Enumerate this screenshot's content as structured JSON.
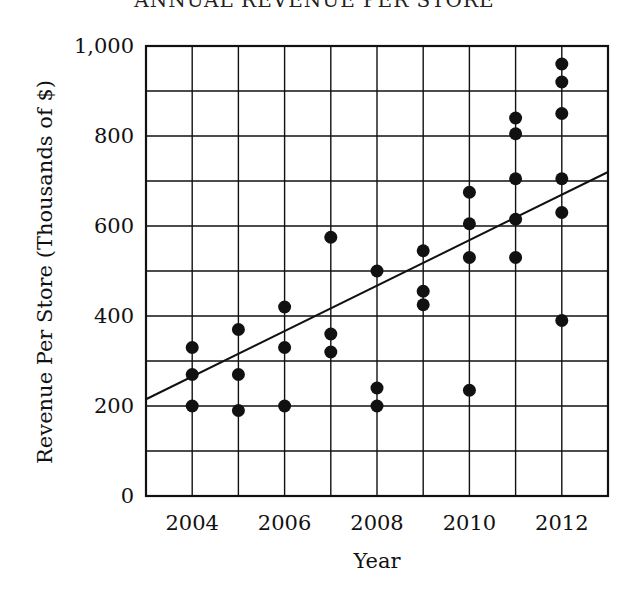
{
  "chart_data": {
    "type": "scatter",
    "title": "ANNUAL REVENUE PER STORE",
    "xlabel": "Year",
    "ylabel": "Revenue Per Store (Thousands of $)",
    "xlim": [
      2003,
      2013
    ],
    "ylim": [
      0,
      1000
    ],
    "x_tick_labels": [
      "2004",
      "2006",
      "2008",
      "2010",
      "2012"
    ],
    "x_ticks": [
      2004,
      2006,
      2008,
      2010,
      2012
    ],
    "y_tick_labels": [
      "0",
      "200",
      "400",
      "600",
      "800",
      "1,000"
    ],
    "y_ticks": [
      0,
      200,
      400,
      600,
      800,
      1000
    ],
    "grid": true,
    "grid_x_step": 1,
    "grid_y_step": 100,
    "legend": null,
    "series": [
      {
        "name": "stores",
        "points": [
          {
            "x": 2004,
            "y": 330
          },
          {
            "x": 2004,
            "y": 270
          },
          {
            "x": 2004,
            "y": 200
          },
          {
            "x": 2005,
            "y": 370
          },
          {
            "x": 2005,
            "y": 270
          },
          {
            "x": 2005,
            "y": 190
          },
          {
            "x": 2006,
            "y": 420
          },
          {
            "x": 2006,
            "y": 330
          },
          {
            "x": 2006,
            "y": 200
          },
          {
            "x": 2007,
            "y": 575
          },
          {
            "x": 2007,
            "y": 360
          },
          {
            "x": 2007,
            "y": 320
          },
          {
            "x": 2008,
            "y": 500
          },
          {
            "x": 2008,
            "y": 240
          },
          {
            "x": 2008,
            "y": 200
          },
          {
            "x": 2009,
            "y": 545
          },
          {
            "x": 2009,
            "y": 455
          },
          {
            "x": 2009,
            "y": 425
          },
          {
            "x": 2010,
            "y": 675
          },
          {
            "x": 2010,
            "y": 605
          },
          {
            "x": 2010,
            "y": 530
          },
          {
            "x": 2010,
            "y": 235
          },
          {
            "x": 2011,
            "y": 840
          },
          {
            "x": 2011,
            "y": 805
          },
          {
            "x": 2011,
            "y": 705
          },
          {
            "x": 2011,
            "y": 615
          },
          {
            "x": 2011,
            "y": 530
          },
          {
            "x": 2012,
            "y": 960
          },
          {
            "x": 2012,
            "y": 920
          },
          {
            "x": 2012,
            "y": 850
          },
          {
            "x": 2012,
            "y": 705
          },
          {
            "x": 2012,
            "y": 630
          },
          {
            "x": 2012,
            "y": 390
          }
        ]
      }
    ],
    "trend_line": {
      "name": "line of best fit",
      "x0": 2003,
      "y0": 215,
      "x1": 2013,
      "y1": 720
    }
  },
  "colors": {
    "ink": "#111111",
    "background": "#ffffff"
  }
}
